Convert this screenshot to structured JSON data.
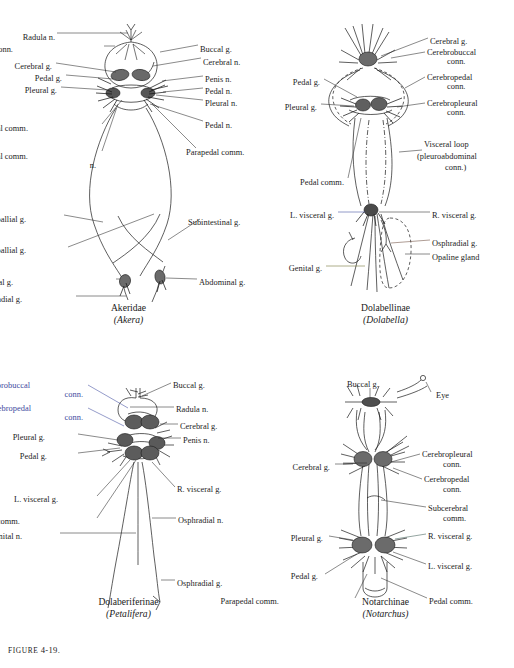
{
  "figure": {
    "number_prefix": "FIGURE",
    "number": "4-19."
  },
  "panels": [
    {
      "id": "akera",
      "caption_family": "Akeridae",
      "caption_genus": "(Akera)",
      "labels": [
        {
          "text": "Radula n.",
          "x": 55,
          "y": 33,
          "align": "right"
        },
        {
          "text": "Cerebrobuccal conn.",
          "x": 13,
          "y": 45,
          "align": "right"
        },
        {
          "text": "Cerebral g.",
          "x": 52,
          "y": 62,
          "align": "right"
        },
        {
          "text": "Pedal g.",
          "x": 62,
          "y": 74,
          "align": "right"
        },
        {
          "text": "Pleural g.",
          "x": 57,
          "y": 86,
          "align": "right"
        },
        {
          "text": "Pedal comm.",
          "x": 28,
          "y": 124,
          "align": "right"
        },
        {
          "text": "Parapedal comm.",
          "x": 28,
          "y": 152,
          "align": "right"
        },
        {
          "text": "n.",
          "x": 96,
          "y": 161,
          "align": "right"
        },
        {
          "text": "L. pallial g.",
          "x": 26,
          "y": 215,
          "align": "right"
        },
        {
          "text": "R. pallial g.",
          "x": 26,
          "y": 246,
          "align": "right"
        },
        {
          "text": "Supraintestinal g.",
          "x": 13,
          "y": 278,
          "align": "right"
        },
        {
          "text": "Osphradial g.",
          "x": 22,
          "y": 295,
          "align": "right"
        },
        {
          "text": "Buccal g.",
          "x": 200,
          "y": 45,
          "align": "left"
        },
        {
          "text": "Cerebral n.",
          "x": 203,
          "y": 58,
          "align": "left"
        },
        {
          "text": "Penis n.",
          "x": 205,
          "y": 75,
          "align": "left"
        },
        {
          "text": "Pedal n.",
          "x": 205,
          "y": 87,
          "align": "left"
        },
        {
          "text": "Pleural n.",
          "x": 205,
          "y": 99,
          "align": "left"
        },
        {
          "text": "Pedal n.",
          "x": 205,
          "y": 121,
          "align": "left"
        },
        {
          "text": "Parapedal comm.",
          "x": 186,
          "y": 148,
          "align": "left"
        },
        {
          "text": "Subintestinal g.",
          "x": 188,
          "y": 218,
          "align": "left"
        },
        {
          "text": "Abdominal g.",
          "x": 199,
          "y": 278,
          "align": "left"
        }
      ]
    },
    {
      "id": "dolabella",
      "caption_family": "Dolabellinae",
      "caption_genus": "(Dolabella)",
      "labels": [
        {
          "text": "Pedal g.",
          "x": 63,
          "y": 78,
          "align": "right"
        },
        {
          "text": "Pleural g.",
          "x": 60,
          "y": 103,
          "align": "right"
        },
        {
          "text": "Pedal comm.",
          "x": 87,
          "y": 178,
          "align": "right"
        },
        {
          "text": "L. visceral g.",
          "x": 77,
          "y": 211,
          "align": "right"
        },
        {
          "text": "Genital g.",
          "x": 65,
          "y": 264,
          "align": "right"
        },
        {
          "text": "Cerebral g.",
          "x": 173,
          "y": 37,
          "align": "left"
        },
        {
          "text": "Cerebrobuccal",
          "x": 170,
          "y": 48,
          "align": "left"
        },
        {
          "text": "conn.",
          "x": 190,
          "y": 57,
          "align": "left"
        },
        {
          "text": "Cerebropedal",
          "x": 170,
          "y": 73,
          "align": "left"
        },
        {
          "text": "conn.",
          "x": 190,
          "y": 82,
          "align": "left"
        },
        {
          "text": "Cerebropleural",
          "x": 170,
          "y": 99,
          "align": "left"
        },
        {
          "text": "conn.",
          "x": 190,
          "y": 108,
          "align": "left"
        },
        {
          "text": "Visceral loop",
          "x": 167,
          "y": 140,
          "align": "left"
        },
        {
          "text": "(pleuroabdominal",
          "x": 160,
          "y": 152,
          "align": "left"
        },
        {
          "text": "conn.)",
          "x": 188,
          "y": 163,
          "align": "left"
        },
        {
          "text": "R. visceral g.",
          "x": 175,
          "y": 211,
          "align": "left"
        },
        {
          "text": "Osphradial g.",
          "x": 175,
          "y": 239,
          "align": "left"
        },
        {
          "text": "Opaline gland",
          "x": 175,
          "y": 253,
          "align": "left"
        }
      ]
    },
    {
      "id": "petalifera",
      "caption_family": "Dolaberiferinae",
      "caption_genus": "(Petalifera)",
      "labels": [
        {
          "text": "Cerebrobuccal",
          "x": 30,
          "y": 41,
          "align": "right",
          "color": "blue"
        },
        {
          "text": "conn.",
          "x": 83,
          "y": 50,
          "align": "right",
          "color": "blue"
        },
        {
          "text": "Cerebropedal",
          "x": 31,
          "y": 64,
          "align": "right",
          "color": "blue"
        },
        {
          "text": "conn.",
          "x": 83,
          "y": 73,
          "align": "right",
          "color": "blue"
        },
        {
          "text": "Pleural g.",
          "x": 45,
          "y": 93,
          "align": "right"
        },
        {
          "text": "Pedal g.",
          "x": 47,
          "y": 112,
          "align": "right"
        },
        {
          "text": "L. visceral g.",
          "x": 58,
          "y": 155,
          "align": "right"
        },
        {
          "text": "Parapedal comm.",
          "x": 20,
          "y": 177,
          "align": "right"
        },
        {
          "text": "Genital n.",
          "x": 22,
          "y": 192,
          "align": "right"
        },
        {
          "text": "Buccal g.",
          "x": 173,
          "y": 41,
          "align": "left"
        },
        {
          "text": "Radula n.",
          "x": 176,
          "y": 65,
          "align": "left"
        },
        {
          "text": "Cerebral g.",
          "x": 180,
          "y": 82,
          "align": "left"
        },
        {
          "text": "Penis n.",
          "x": 183,
          "y": 96,
          "align": "left"
        },
        {
          "text": "R. visceral g.",
          "x": 177,
          "y": 145,
          "align": "left"
        },
        {
          "text": "Osphradial n.",
          "x": 178,
          "y": 176,
          "align": "left"
        },
        {
          "text": "Osphradial g.",
          "x": 177,
          "y": 239,
          "align": "left"
        }
      ]
    },
    {
      "id": "notarchus",
      "caption_family": "Notarchinae",
      "caption_genus": "(Notarchus)",
      "labels": [
        {
          "text": "Buccal g.",
          "x": 90,
          "y": 40,
          "align": "left"
        },
        {
          "text": "Cerebral g.",
          "x": 73,
          "y": 123,
          "align": "right"
        },
        {
          "text": "Pleural g.",
          "x": 66,
          "y": 194,
          "align": "right"
        },
        {
          "text": "Pedal g.",
          "x": 61,
          "y": 232,
          "align": "right"
        },
        {
          "text": "Parapedal comm.",
          "x": 22,
          "y": 257,
          "align": "right"
        },
        {
          "text": "Eye",
          "x": 179,
          "y": 51,
          "align": "left"
        },
        {
          "text": "Cerebropleural",
          "x": 165,
          "y": 110,
          "align": "left"
        },
        {
          "text": "conn.",
          "x": 186,
          "y": 120,
          "align": "left"
        },
        {
          "text": "Cerebropedal",
          "x": 167,
          "y": 135,
          "align": "left"
        },
        {
          "text": "conn.",
          "x": 186,
          "y": 145,
          "align": "left"
        },
        {
          "text": "Subcerebral",
          "x": 171,
          "y": 164,
          "align": "left"
        },
        {
          "text": "comm.",
          "x": 186,
          "y": 174,
          "align": "left"
        },
        {
          "text": "R. visceral g.",
          "x": 171,
          "y": 192,
          "align": "left"
        },
        {
          "text": "L. visceral g.",
          "x": 171,
          "y": 222,
          "align": "left"
        },
        {
          "text": "Pedal comm.",
          "x": 172,
          "y": 257,
          "align": "left"
        }
      ]
    }
  ]
}
